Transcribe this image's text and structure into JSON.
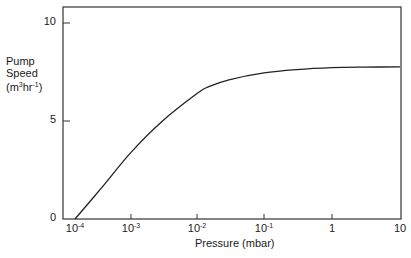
{
  "chart_data": {
    "type": "line",
    "title": "",
    "xlabel": "Pressure (mbar)",
    "ylabel": "Pump Speed (m3hr-1)",
    "ylabel_lines": [
      "Pump",
      "Speed",
      "(m",
      "3",
      "hr",
      "-1",
      ")"
    ],
    "xscale": "log",
    "xlim": [
      0.0001,
      10
    ],
    "ylim": [
      0,
      10.8
    ],
    "grid": false,
    "x_ticks": [
      {
        "base": "10",
        "exp": "-4",
        "value": 0.0001,
        "px": 75
      },
      {
        "base": "10",
        "exp": "-3",
        "value": 0.001,
        "px": 131
      },
      {
        "base": "10",
        "exp": "-2",
        "value": 0.01,
        "px": 197
      },
      {
        "base": "10",
        "exp": "-1",
        "value": 0.1,
        "px": 264
      },
      {
        "base": "1",
        "exp": "",
        "value": 1,
        "px": 332
      },
      {
        "base": "10",
        "exp": "",
        "value": 10,
        "px": 400
      }
    ],
    "y_ticks": [
      {
        "label": "0",
        "value": 0
      },
      {
        "label": "5",
        "value": 5
      },
      {
        "label": "10",
        "value": 10
      }
    ],
    "series": [
      {
        "name": "Pump speed",
        "x": [
          0.0001,
          0.0003,
          0.001,
          0.003,
          0.01,
          0.015,
          0.03,
          0.1,
          0.3,
          1,
          3,
          10
        ],
        "values": [
          0,
          1.6,
          3.4,
          5.0,
          6.4,
          6.75,
          7.1,
          7.45,
          7.62,
          7.72,
          7.75,
          7.76
        ]
      }
    ]
  }
}
